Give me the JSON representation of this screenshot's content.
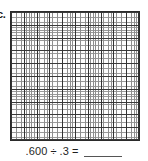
{
  "worksheet": {
    "problem_label": "c.",
    "grid": {
      "name": "hundredths-decimal-grid",
      "major_columns": 10,
      "major_rows": 10,
      "minor_per_major": 5,
      "total_minor_columns": 50,
      "total_minor_rows": 50,
      "border_color": "#2b2b2b",
      "major_line_color": "#333333",
      "minor_line_color": "#8e8e8e",
      "fill_color": "#fdfdfd",
      "shaded_cells": 0
    },
    "equation": {
      "dividend": ".600",
      "operator": "÷",
      "divisor": ".3",
      "equals": "=",
      "answer": "",
      "full_text": ".600 ÷ .3 ="
    }
  }
}
